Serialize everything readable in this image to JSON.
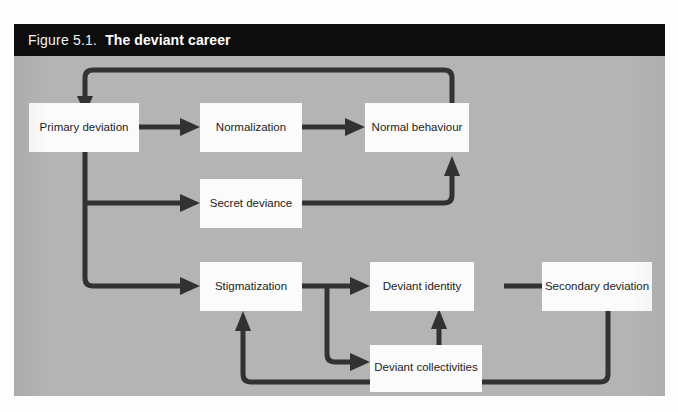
{
  "figure": {
    "number": "Figure 5.1.",
    "title": "The deviant career",
    "panel_color": "#b4b4b4",
    "title_bar_color": "#0d0d0d",
    "node_fill": "#fbfbfb",
    "line_color": "#323232"
  },
  "nodes": [
    {
      "id": "primary-deviation",
      "label": "Primary deviation"
    },
    {
      "id": "normalization",
      "label": "Normalization"
    },
    {
      "id": "normal-behaviour",
      "label": "Normal behaviour"
    },
    {
      "id": "secret-deviance",
      "label": "Secret deviance"
    },
    {
      "id": "stigmatization",
      "label": "Stigmatization"
    },
    {
      "id": "deviant-identity",
      "label": "Deviant identity"
    },
    {
      "id": "secondary-deviation",
      "label": "Secondary deviation"
    },
    {
      "id": "deviant-collectivities",
      "label": "Deviant collectivities"
    }
  ],
  "edges": [
    {
      "from": "primary-deviation",
      "to": "normalization"
    },
    {
      "from": "normalization",
      "to": "normal-behaviour"
    },
    {
      "from": "normal-behaviour",
      "to": "primary-deviation"
    },
    {
      "from": "primary-deviation",
      "to": "secret-deviance"
    },
    {
      "from": "secret-deviance",
      "to": "normal-behaviour"
    },
    {
      "from": "primary-deviation",
      "to": "stigmatization"
    },
    {
      "from": "stigmatization",
      "to": "deviant-identity"
    },
    {
      "from": "stigmatization",
      "to": "deviant-collectivities"
    },
    {
      "from": "deviant-collectivities",
      "to": "deviant-identity"
    },
    {
      "from": "deviant-identity",
      "to": "secondary-deviation"
    },
    {
      "from": "secondary-deviation",
      "to": "stigmatization"
    }
  ]
}
